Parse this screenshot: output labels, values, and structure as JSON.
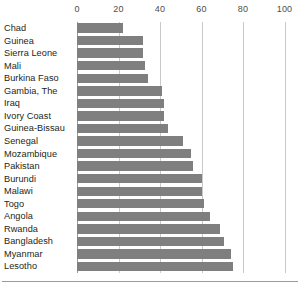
{
  "chart_data": {
    "type": "bar",
    "orientation": "horizontal",
    "title": "",
    "subtitle": "",
    "xlabel": "",
    "ylabel": "",
    "xlim": [
      0,
      100
    ],
    "ylim": null,
    "grid": true,
    "legend": false,
    "legend_position": "none",
    "bar_color": "#7f7f7f",
    "gridline_color": "#c9c9c9",
    "axis_color": "#9a9a9a",
    "text_color": "#231f20",
    "x_ticks": [
      0,
      20,
      40,
      60,
      80,
      100
    ],
    "x_tick_labels": [
      "0",
      "20",
      "40",
      "60",
      "80",
      "100"
    ],
    "categories": [
      "Chad",
      "Guinea",
      "Sierra Leone",
      "Mali",
      "Burkina Faso",
      "Gambia, The",
      "Iraq",
      "Ivory Coast",
      "Guinea-Bissau",
      "Senegal",
      "Mozambique",
      "Pakistan",
      "Burundi",
      "Malawi",
      "Togo",
      "Angola",
      "Rwanda",
      "Bangladesh",
      "Myanmar",
      "Lesotho"
    ],
    "values": [
      22,
      32,
      32,
      33,
      34,
      41,
      42,
      42,
      44,
      51,
      55,
      56,
      60,
      60,
      61,
      64,
      69,
      71,
      74,
      75
    ],
    "series": [
      {
        "name": "",
        "values": [
          22,
          32,
          32,
          33,
          34,
          41,
          42,
          42,
          44,
          51,
          55,
          56,
          60,
          60,
          61,
          64,
          69,
          71,
          74,
          75
        ]
      }
    ]
  }
}
